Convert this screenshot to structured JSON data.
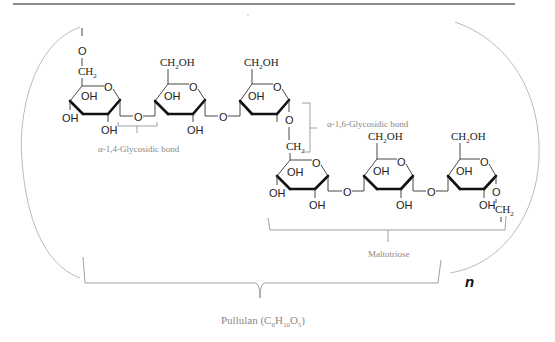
{
  "diagram": {
    "repeat_label": "n",
    "labels": {
      "alpha14": "α-1,4-Glycosidic bond",
      "alpha16": "α-1,6-Glycosidic bond",
      "maltotriose": "Maltotriose",
      "pullulan_prefix": "Pullulan (C",
      "pullulan_sub1": "6",
      "pullulan_h": "H",
      "pullulan_sub2": "10",
      "pullulan_o": "O",
      "pullulan_sub3": "5",
      "pullulan_suffix": ")"
    },
    "atoms": {
      "O": "O",
      "OH": "OH",
      "CH2": "CH",
      "CH2OH_a": "CH",
      "CH2OH_b": "OH",
      "sub2": "2"
    },
    "rings": [
      {
        "id": "glucose-1",
        "row": "top",
        "substituents": [
          "O-CH2",
          "OH",
          "OH",
          "OH"
        ]
      },
      {
        "id": "glucose-2",
        "row": "top",
        "substituents": [
          "CH2OH",
          "OH",
          "OH"
        ]
      },
      {
        "id": "glucose-3",
        "row": "top",
        "substituents": [
          "CH2OH",
          "OH"
        ]
      },
      {
        "id": "glucose-4",
        "row": "bottom",
        "substituents": [
          "CH2",
          "OH",
          "OH",
          "OH"
        ]
      },
      {
        "id": "glucose-5",
        "row": "bottom",
        "substituents": [
          "CH2OH",
          "OH",
          "OH"
        ]
      },
      {
        "id": "glucose-6",
        "row": "bottom",
        "substituents": [
          "CH2OH",
          "OH",
          "OH",
          "O-CH2"
        ]
      }
    ],
    "colors": {
      "structure": "#222222",
      "captions": "#888888",
      "brackets": "#aaaaaa",
      "rule": "#555555"
    }
  }
}
